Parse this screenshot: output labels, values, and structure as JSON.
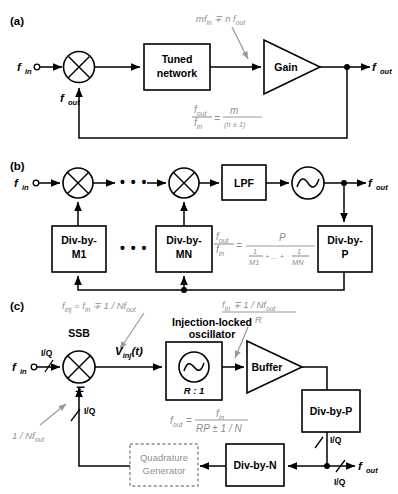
{
  "figure": {
    "panels": [
      {
        "id": "a",
        "label": "(a)",
        "input_label": "f",
        "input_sub": "in",
        "feedback_label": "f",
        "feedback_sub": "out",
        "output_label": "f",
        "output_sub": "out",
        "blocks": [
          {
            "name": "tuned-network",
            "line1": "Tuned",
            "line2": "network"
          },
          {
            "name": "gain-amplifier",
            "line1": "Gain"
          }
        ],
        "annotation": {
          "text": "mf",
          "sub1": "in",
          "op": " ∓ n f",
          "sub2": "out"
        },
        "equation": {
          "num_top": "f",
          "num_top_sub": "out",
          "num_bot": "f",
          "num_bot_sub": "in",
          "equals": "=",
          "rhs_num": "m",
          "rhs_den": "(n ± 1)"
        }
      },
      {
        "id": "b",
        "label": "(b)",
        "input_label": "f",
        "input_sub": "in",
        "output_label": "f",
        "output_sub": "out",
        "ellipsis": "• • •",
        "blocks": [
          {
            "name": "lpf",
            "line1": "LPF"
          },
          {
            "name": "div-by-m1",
            "line1": "Div-by-",
            "line2": "M1"
          },
          {
            "name": "div-by-mn",
            "line1": "Div-by-",
            "line2": "MN"
          },
          {
            "name": "div-by-p",
            "line1": "Div-by-",
            "line2": "P"
          }
        ],
        "equation": {
          "num_top": "f",
          "num_top_sub": "out",
          "num_bot": "f",
          "num_bot_sub": "in",
          "equals": "=",
          "rhs_num": "P",
          "rhs_den_1": "1",
          "rhs_den_m1": "M1",
          "rhs_den_plus": "+ ... +",
          "rhs_den_2": "1",
          "rhs_den_mn": "MN"
        }
      },
      {
        "id": "c",
        "label": "(c)",
        "input_label": "f",
        "input_sub": "in",
        "output_label": "f",
        "output_sub": "out",
        "ssb_label": "SSB",
        "mixer_sign": "∓",
        "iq_labels": [
          "I/Q",
          "I/Q",
          "I/Q",
          "I/Q"
        ],
        "vinj": {
          "v": "V",
          "sub": "inj",
          "tail": "(t)"
        },
        "ilo_title_1": "Injection-locked",
        "ilo_title_2": "oscillator",
        "ilo_ratio": "R : 1",
        "blocks": [
          {
            "name": "buffer",
            "line1": "Buffer"
          },
          {
            "name": "div-by-p",
            "line1": "Div-by-P"
          },
          {
            "name": "div-by-n",
            "line1": "Div-by-N"
          },
          {
            "name": "quadrature-generator",
            "line1": "Quadrature",
            "line2": "Generator"
          }
        ],
        "annotations": {
          "finj": {
            "a": "f",
            "a_sub": "inj",
            "b": " = f",
            "b_sub": "in",
            "c": " ∓ 1 / Nf",
            "c_sub": "out"
          },
          "fin_over_r": {
            "num_a": "f",
            "num_a_sub": "in",
            "num_b": " ∓ 1 / Nf",
            "num_b_sub": "out",
            "den": "R"
          },
          "one_over_nfout": {
            "a": "1 / Nf",
            "a_sub": "out"
          }
        },
        "equation": {
          "lhs": "f",
          "lhs_sub": "out",
          "equals": "=",
          "rhs_num": "f",
          "rhs_num_sub": "in",
          "rhs_den": "RP ± 1 / N"
        }
      }
    ]
  },
  "colors": {
    "ink": "#000000",
    "gray_annotation": "#8f8f8f",
    "background": "#ffffff"
  }
}
